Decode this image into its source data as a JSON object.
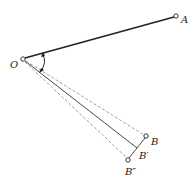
{
  "diagram": {
    "points": {
      "O": {
        "label": "O",
        "x": 23,
        "y": 59
      },
      "A": {
        "label": "A",
        "x": 176,
        "y": 16
      },
      "B": {
        "label": "B",
        "x": 146,
        "y": 136
      },
      "B1": {
        "label": "B′",
        "x": 137,
        "y": 148
      },
      "B2": {
        "label": "B″",
        "x": 128,
        "y": 160
      }
    },
    "colors": {
      "line": "#222222",
      "dashed": "#888888",
      "background": "#ffffff"
    }
  }
}
